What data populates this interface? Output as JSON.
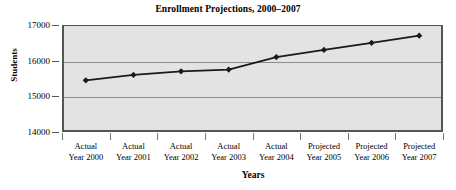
{
  "chart_data": {
    "type": "line",
    "title": "Enrollment Projections, 2000–2007",
    "xlabel": "Years",
    "ylabel": "Students",
    "categories": [
      "Actual\nYear 2000",
      "Actual\nYear 2001",
      "Actual\nYear 2002",
      "Actual\nYear 2003",
      "Actual\nYear 2004",
      "Projected\nYear 2005",
      "Projected\nYear 2006",
      "Projected\nYear 2007"
    ],
    "category_lines": [
      [
        "Actual",
        "Year 2000"
      ],
      [
        "Actual",
        "Year 2001"
      ],
      [
        "Actual",
        "Year 2002"
      ],
      [
        "Actual",
        "Year 2003"
      ],
      [
        "Actual",
        "Year 2004"
      ],
      [
        "Projected",
        "Year 2005"
      ],
      [
        "Projected",
        "Year 2006"
      ],
      [
        "Projected",
        "Year 2007"
      ]
    ],
    "values": [
      15450,
      15600,
      15700,
      15750,
      16100,
      16300,
      16500,
      16700
    ],
    "ylim": [
      14000,
      17000
    ],
    "yticks": [
      14000,
      15000,
      16000,
      17000
    ],
    "ytick_labels": [
      "14000",
      "15000",
      "16000",
      "17000"
    ],
    "grid": true,
    "legend": false,
    "series_color": "#1a1a1a",
    "plot_background": "#e3e3e3",
    "gridline_color": "#8c8c8c",
    "axis_color": "#555555",
    "marker": "diamond"
  }
}
